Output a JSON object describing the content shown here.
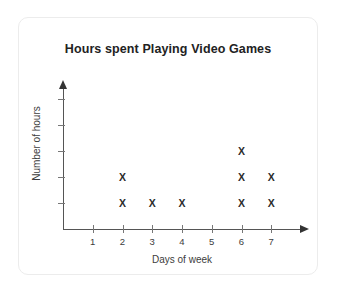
{
  "card": {
    "background_color": "#ffffff",
    "border_color": "#ececec"
  },
  "chart_data": {
    "type": "scatter",
    "title": "Hours spent Playing Video Games",
    "xlabel": "Days of week",
    "ylabel": "Number of hours",
    "categories": [
      "1",
      "2",
      "3",
      "4",
      "5",
      "6",
      "7"
    ],
    "x": [
      1,
      2,
      3,
      4,
      5,
      6,
      7
    ],
    "values": [
      0,
      2,
      1,
      1,
      0,
      3,
      2
    ],
    "marker": "X",
    "marker_color": "#2b2b2b",
    "xlim": [
      0,
      8
    ],
    "ylim": [
      0,
      5
    ],
    "y_ticks": [
      1,
      2,
      3,
      4,
      5
    ],
    "y_tick_labels": [
      "",
      "",
      "",
      "",
      ""
    ],
    "x_tick_labels": [
      "1",
      "2",
      "3",
      "4",
      "5",
      "6",
      "7"
    ],
    "grid": false,
    "legend": false,
    "axis_arrows": true,
    "points": [
      {
        "x": 2,
        "y": 1
      },
      {
        "x": 2,
        "y": 2
      },
      {
        "x": 3,
        "y": 1
      },
      {
        "x": 4,
        "y": 1
      },
      {
        "x": 6,
        "y": 1
      },
      {
        "x": 6,
        "y": 2
      },
      {
        "x": 6,
        "y": 3
      },
      {
        "x": 7,
        "y": 1
      },
      {
        "x": 7,
        "y": 2
      }
    ]
  }
}
